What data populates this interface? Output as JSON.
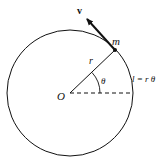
{
  "diagram": {
    "labels": {
      "velocity": "v",
      "mass": "m",
      "radius": "r",
      "angle": "θ",
      "center": "O",
      "arc_length": "l = r θ"
    },
    "colors": {
      "stroke": "#111111",
      "background": "#ffffff"
    }
  }
}
